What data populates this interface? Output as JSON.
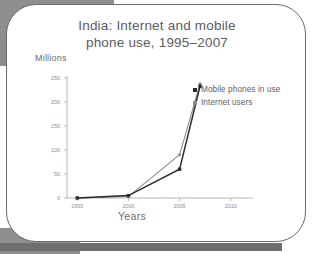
{
  "card": {
    "title_line1": "India: Internet and mobile",
    "title_line2": "phone use, 1995–2007"
  },
  "chart_data": {
    "type": "line",
    "title": "India: Internet and mobile phone use, 1995–2007",
    "xlabel": "Years",
    "ylabel": "Millions",
    "xlim": [
      1994,
      2011
    ],
    "ylim": [
      0,
      250
    ],
    "xticks": [
      1995,
      2000,
      2005,
      2010
    ],
    "xtick_labels": [
      "1995",
      "2000",
      "2005",
      "2010"
    ],
    "yticks": [
      0,
      50,
      100,
      150,
      200,
      250
    ],
    "ytick_labels": [
      "0",
      "50",
      "100",
      "150",
      "200",
      "250"
    ],
    "grid": false,
    "legend_position": "inside-upper-right",
    "x": [
      1995,
      2000,
      2005,
      2007
    ],
    "series": [
      {
        "name": "Mobile phones in use",
        "color": "#2b2b2b",
        "marker": "square",
        "values": [
          0,
          5,
          60,
          233
        ]
      },
      {
        "name": "Internet users",
        "color": "#8a8a8a",
        "marker": "square",
        "values": [
          0,
          3,
          90,
          238
        ]
      }
    ]
  }
}
